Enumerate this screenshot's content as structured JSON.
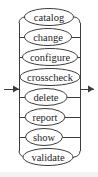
{
  "diagram": {
    "kind": "railroad-syntax-diagram",
    "title": "",
    "entry_arrow": "arrow-right",
    "exit_arrow": "arrow-right",
    "line_color": "#3c3c3c",
    "text_color": "#1e1e1e",
    "background_color": "#ffffff",
    "left_rail_x": 19,
    "right_rail_x": 80,
    "entry_y": 89,
    "exit_y": 89,
    "alternatives": [
      {
        "label": "catalog",
        "y": 17,
        "cx": 49,
        "rx": 24.5,
        "ry": 8.5
      },
      {
        "label": "change",
        "y": 37,
        "cx": 48,
        "rx": 23.5,
        "ry": 8.5
      },
      {
        "label": "configure",
        "y": 57,
        "cx": 50,
        "rx": 27.5,
        "ry": 8.5
      },
      {
        "label": "crosscheck",
        "y": 77,
        "cx": 50,
        "rx": 30.0,
        "ry": 8.5
      },
      {
        "label": "delete",
        "y": 97,
        "cx": 46,
        "rx": 21.0,
        "ry": 8.5
      },
      {
        "label": "report",
        "y": 117,
        "cx": 45,
        "rx": 20.0,
        "ry": 8.5
      },
      {
        "label": "show",
        "y": 137,
        "cx": 44,
        "rx": 18.5,
        "ry": 8.5
      },
      {
        "label": "validate",
        "y": 157,
        "cx": 48,
        "rx": 25.0,
        "ry": 8.5
      }
    ]
  }
}
